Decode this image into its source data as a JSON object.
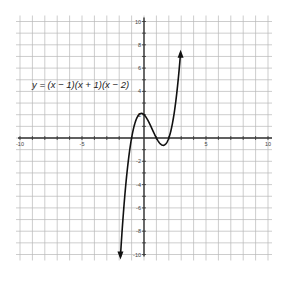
{
  "chart_data": {
    "type": "line",
    "title": "",
    "equation_label": "y = (x − 1)(x + 1)(x − 2)",
    "xlabel": "",
    "ylabel": "",
    "xlim": [
      -10,
      10
    ],
    "ylim": [
      -10,
      10
    ],
    "grid": true,
    "grid_step": 1,
    "x_ticks": [
      -10,
      -5,
      5,
      10
    ],
    "x_tick_labels": [
      "-10",
      "-5",
      "5",
      "10"
    ],
    "y_ticks": [
      -10,
      -8,
      -6,
      -4,
      -2,
      2,
      4,
      6,
      8,
      10
    ],
    "y_tick_labels": [
      "-10",
      "-8",
      "-6",
      "-4",
      "-2",
      "2",
      "4",
      "6",
      "8",
      "10"
    ],
    "series": [
      {
        "name": "y = (x − 1)(x + 1)(x − 2)",
        "function": "(x-1)*(x+1)*(x-2)",
        "x_range": [
          -1.9,
          2.95
        ],
        "arrows": "both",
        "key_points": [
          {
            "x": -1,
            "y": 0
          },
          {
            "x": 0,
            "y": 2
          },
          {
            "x": 1,
            "y": 0
          },
          {
            "x": 2,
            "y": 0
          },
          {
            "x": 1.55,
            "y": -0.63
          }
        ]
      }
    ]
  },
  "colors": {
    "grid": "#b8b8b8",
    "axis": "#333333",
    "curve": "#111111"
  }
}
